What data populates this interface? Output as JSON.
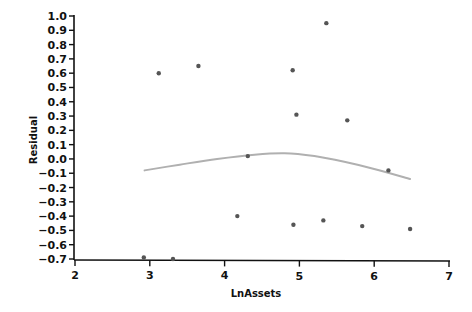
{
  "chart_data": {
    "type": "scatter",
    "title": "",
    "xlabel": "LnAssets",
    "ylabel": "Residual",
    "xlim": [
      2,
      7
    ],
    "ylim": [
      -0.7,
      1.0
    ],
    "grid": false,
    "legend": null,
    "x_ticks": [
      2,
      3,
      4,
      5,
      6,
      7
    ],
    "x_tick_labels": [
      "2",
      "3",
      "4",
      "5",
      "6",
      "7"
    ],
    "y_ticks": [
      1.0,
      0.9,
      0.8,
      0.7,
      0.6,
      0.5,
      0.4,
      0.3,
      0.2,
      0.1,
      0.0,
      -0.1,
      -0.2,
      -0.3,
      -0.4,
      -0.5,
      -0.6,
      -0.7
    ],
    "y_tick_labels": [
      "1.0",
      "0.9",
      "0.8",
      "0.7",
      "0.6",
      "0.5",
      "0.4",
      "0.3",
      "0.2",
      "0.1",
      "0.0",
      "-0.1",
      "-0.2",
      "-0.3",
      "-0.4",
      "-0.5",
      "-0.6",
      "-0.7"
    ],
    "series": [
      {
        "name": "Residuals",
        "kind": "scatter",
        "color": "#555555",
        "points": [
          {
            "x": 3.12,
            "y": 0.6
          },
          {
            "x": 3.65,
            "y": 0.65
          },
          {
            "x": 4.91,
            "y": 0.62
          },
          {
            "x": 5.36,
            "y": 0.95
          },
          {
            "x": 4.96,
            "y": 0.31
          },
          {
            "x": 5.64,
            "y": 0.27
          },
          {
            "x": 4.31,
            "y": 0.02
          },
          {
            "x": 6.19,
            "y": -0.08
          },
          {
            "x": 4.17,
            "y": -0.4
          },
          {
            "x": 4.92,
            "y": -0.46
          },
          {
            "x": 5.32,
            "y": -0.43
          },
          {
            "x": 5.84,
            "y": -0.47
          },
          {
            "x": 6.48,
            "y": -0.49
          },
          {
            "x": 2.92,
            "y": -0.69
          },
          {
            "x": 3.31,
            "y": -0.7
          }
        ]
      },
      {
        "name": "Smoothed fit",
        "kind": "line",
        "color": "#b0b0b0",
        "points": [
          {
            "x": 2.93,
            "y": -0.08
          },
          {
            "x": 3.4,
            "y": -0.04
          },
          {
            "x": 3.9,
            "y": 0.0
          },
          {
            "x": 4.4,
            "y": 0.03
          },
          {
            "x": 4.8,
            "y": 0.04
          },
          {
            "x": 5.2,
            "y": 0.02
          },
          {
            "x": 5.6,
            "y": -0.02
          },
          {
            "x": 6.0,
            "y": -0.07
          },
          {
            "x": 6.48,
            "y": -0.14
          }
        ]
      }
    ]
  },
  "layout": {
    "plot": {
      "x0": 75,
      "x1": 449,
      "y_top": 16,
      "y_bottom": 259
    },
    "axis_color": "#111111"
  }
}
